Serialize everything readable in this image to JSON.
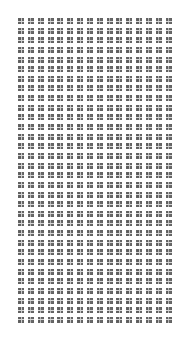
{
  "image": {
    "kind": "repeating-grid-pattern",
    "width": 192,
    "height": 340,
    "background_color": "#ffffff",
    "alt_text": "Uniform repeating grid of small dark squares on a white background"
  },
  "grid": {
    "columns": 16,
    "rows": 32,
    "total_cells": 512,
    "offset_left": 18,
    "offset_top": 18,
    "cell_size": 6,
    "column_pitch": 9.85,
    "row_pitch": 9.65,
    "gap_x": 3.85,
    "gap_y": 3.65
  },
  "motif": {
    "name": "sub-divided-square",
    "fill_color": "#6f6f6f",
    "line_color": "#d8d8d8",
    "edge_color": "#5a5a5a",
    "subdivisions": 2
  },
  "caption": ""
}
